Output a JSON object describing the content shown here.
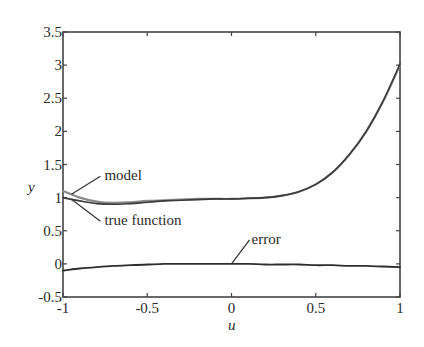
{
  "chart_data": {
    "type": "line",
    "title": "",
    "xlabel": "u",
    "ylabel": "y",
    "xlim": [
      -1,
      1
    ],
    "ylim": [
      -0.5,
      3.5
    ],
    "grid": false,
    "xticks": [
      -1,
      -0.5,
      0,
      0.5,
      1
    ],
    "xtick_labels": [
      "-1",
      "-0.5",
      "0",
      "0.5",
      "1"
    ],
    "yticks": [
      -0.5,
      0,
      0.5,
      1,
      1.5,
      2,
      2.5,
      3,
      3.5
    ],
    "ytick_labels": [
      "-0.5",
      "0",
      "0.5",
      "1",
      "1.5",
      "2",
      "2.5",
      "3",
      "3.5"
    ],
    "x": [
      -1,
      -0.9,
      -0.8,
      -0.7,
      -0.6,
      -0.5,
      -0.4,
      -0.3,
      -0.2,
      -0.1,
      0,
      0.1,
      0.2,
      0.3,
      0.4,
      0.5,
      0.6,
      0.7,
      0.8,
      0.9,
      1
    ],
    "series": [
      {
        "name": "model",
        "values": [
          1.1,
          1.0,
          0.94,
          0.92,
          0.93,
          0.95,
          0.96,
          0.97,
          0.98,
          0.98,
          0.98,
          0.99,
          1.0,
          1.03,
          1.09,
          1.2,
          1.38,
          1.65,
          2.0,
          2.45,
          3.0
        ]
      },
      {
        "name": "true function",
        "values": [
          1.0,
          0.95,
          0.91,
          0.9,
          0.91,
          0.93,
          0.95,
          0.96,
          0.97,
          0.98,
          0.98,
          0.99,
          1.0,
          1.03,
          1.09,
          1.2,
          1.38,
          1.65,
          2.0,
          2.46,
          3.02
        ]
      },
      {
        "name": "error",
        "values": [
          -0.1,
          -0.07,
          -0.05,
          -0.03,
          -0.02,
          -0.01,
          0.0,
          0.0,
          0.0,
          0.0,
          0.0,
          0.0,
          -0.01,
          -0.01,
          -0.01,
          -0.02,
          -0.02,
          -0.03,
          -0.03,
          -0.04,
          -0.05
        ]
      }
    ],
    "annotations": [
      {
        "text": "model",
        "target_series": "model",
        "at_x": -0.95
      },
      {
        "text": "true function",
        "target_series": "true function",
        "at_x": -0.95
      },
      {
        "text": "error",
        "target_series": "error",
        "at_x": 0.0
      }
    ]
  }
}
